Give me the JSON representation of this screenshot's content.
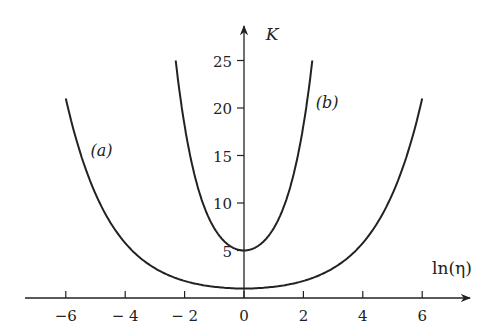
{
  "chart_data": {
    "type": "line",
    "title": "",
    "xlabel": "ln(η)",
    "ylabel": "K",
    "x_ticks": [
      -6,
      -4,
      -2,
      0,
      2,
      4,
      6
    ],
    "x_tick_labels": [
      "−6",
      "− 4",
      "− 2",
      "0",
      "2",
      "4",
      "6"
    ],
    "y_ticks": [
      5,
      10,
      15,
      20,
      25
    ],
    "y_tick_labels": [
      "5",
      "10",
      "15",
      "20",
      "25"
    ],
    "xlim": [
      -8,
      8
    ],
    "ylim": [
      0,
      28
    ],
    "grid": false,
    "legend": "none",
    "series": [
      {
        "name": "(a)",
        "x": [
          -6,
          -5,
          -4,
          -3,
          -2,
          -1,
          0,
          1,
          2,
          3,
          4,
          5,
          6
        ],
        "y": [
          21,
          11,
          6.3,
          3.2,
          1.6,
          1.1,
          1,
          1.1,
          1.6,
          3.2,
          6.3,
          11,
          21
        ]
      },
      {
        "name": "(b)",
        "x": [
          -2.3,
          -2,
          -1.5,
          -1,
          -0.5,
          0,
          0.5,
          1,
          1.5,
          2,
          2.3
        ],
        "y": [
          25,
          19.5,
          12.5,
          8.3,
          5.8,
          5,
          5.8,
          8.3,
          12.5,
          19.5,
          25
        ]
      }
    ],
    "annotations": [
      {
        "text": "(a)",
        "x": -4.8,
        "y": 15
      },
      {
        "text": "(b)",
        "x": 2.8,
        "y": 20
      }
    ]
  }
}
